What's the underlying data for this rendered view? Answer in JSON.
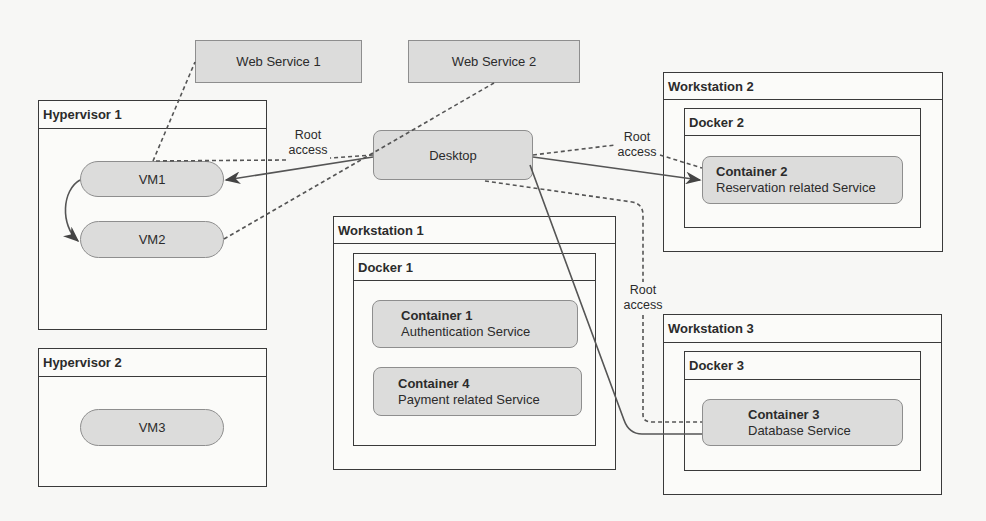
{
  "web_services": [
    {
      "label": "Web Service 1"
    },
    {
      "label": "Web Service 2"
    }
  ],
  "desktop": {
    "label": "Desktop"
  },
  "hypervisors": [
    {
      "title": "Hypervisor 1",
      "vms": [
        "VM1",
        "VM2"
      ]
    },
    {
      "title": "Hypervisor 2",
      "vms": [
        "VM3"
      ]
    }
  ],
  "workstations": [
    {
      "title": "Workstation 1",
      "docker": "Docker 1",
      "containers": [
        {
          "name": "Container 1",
          "service": "Authentication Service"
        },
        {
          "name": "Container 4",
          "service": "Payment related Service"
        }
      ]
    },
    {
      "title": "Workstation 2",
      "docker": "Docker 2",
      "containers": [
        {
          "name": "Container 2",
          "service": "Reservation related Service"
        }
      ]
    },
    {
      "title": "Workstation 3",
      "docker": "Docker 3",
      "containers": [
        {
          "name": "Container 3",
          "service": "Database Service"
        }
      ]
    }
  ],
  "edge_labels": {
    "root_access_1": "Root\naccess",
    "root_access_2": "Root\naccess",
    "root_access_3": "Root\naccess"
  },
  "colors": {
    "node_fill": "#dcdcdb",
    "stroke": "#3a3a3a",
    "background": "#f7f7f5"
  }
}
